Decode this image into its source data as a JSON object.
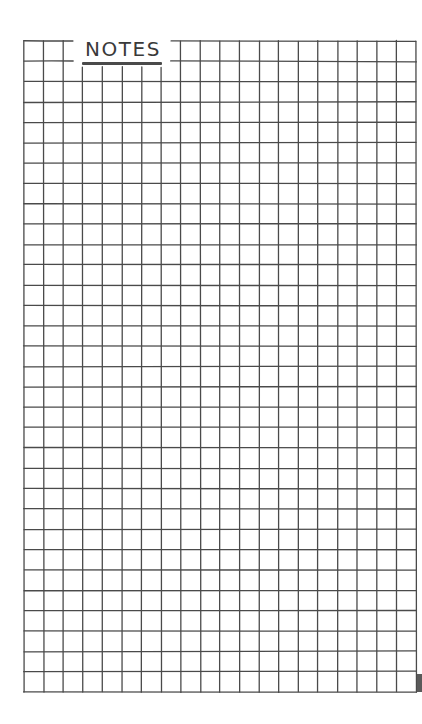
{
  "page": {
    "title": "NOTES",
    "background": "#ffffff",
    "ink_color": "#4a4a4a"
  },
  "grid": {
    "columns": 20,
    "rows": 32,
    "left": 24,
    "top": 41,
    "right": 416,
    "bottom": 692,
    "title_gap": {
      "x_start": 73,
      "x_end": 170,
      "y_end": 67
    }
  }
}
